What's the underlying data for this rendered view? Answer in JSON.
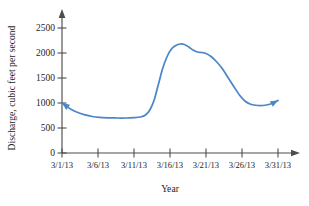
{
  "figure": {
    "background_color": "#ffffff",
    "axis_color": "#4d4d4d"
  },
  "chart_data": {
    "type": "line",
    "title": "",
    "subtitle": "",
    "xlabel": "Year",
    "ylabel": "Discharge, cubic feet per second",
    "line_color": "#4a86c8",
    "grid": false,
    "legend": null,
    "xlim": [
      0,
      31
    ],
    "ylim": [
      0,
      2700
    ],
    "ytick_values": [
      0,
      500,
      1000,
      1500,
      2000,
      2500
    ],
    "ytick_labels": [
      "0",
      "500",
      "1000",
      "1500",
      "2000",
      "2500"
    ],
    "xtick_values": [
      1,
      6,
      11,
      16,
      21,
      26,
      31
    ],
    "xtick_labels": [
      "3/1/13",
      "3/6/13",
      "3/11/13",
      "3/16/13",
      "3/21/13",
      "3/26/13",
      "3/31/13"
    ],
    "start_arrow": true,
    "end_arrow": true,
    "annotations": [],
    "x": [
      1.0,
      1.6,
      2.3,
      3.2,
      4.2,
      5.2,
      6.2,
      7.4,
      8.6,
      9.8,
      11.0,
      11.9,
      12.6,
      13.2,
      13.8,
      14.4,
      15.0,
      15.6,
      16.2,
      16.8,
      17.4,
      18.0,
      18.6,
      19.2,
      19.8,
      20.4,
      21.0,
      21.7,
      22.5,
      23.3,
      24.1,
      24.9,
      25.7,
      26.4,
      27.2,
      28.2,
      29.2,
      30.2,
      31.0
    ],
    "y": [
      1000,
      940,
      870,
      810,
      762,
      730,
      712,
      703,
      700,
      700,
      706,
      720,
      760,
      860,
      1060,
      1380,
      1700,
      1930,
      2080,
      2150,
      2180,
      2170,
      2120,
      2060,
      2020,
      2010,
      1990,
      1930,
      1820,
      1680,
      1500,
      1320,
      1150,
      1040,
      975,
      950,
      955,
      990,
      1050
    ],
    "series": [
      {
        "name": "Discharge",
        "color": "#4a86c8",
        "values": [
          1000,
          940,
          870,
          810,
          762,
          730,
          712,
          703,
          700,
          700,
          706,
          720,
          760,
          860,
          1060,
          1380,
          1700,
          1930,
          2080,
          2150,
          2180,
          2170,
          2120,
          2060,
          2020,
          2010,
          1990,
          1930,
          1820,
          1680,
          1500,
          1320,
          1150,
          1040,
          975,
          950,
          955,
          990,
          1050
        ]
      }
    ]
  }
}
